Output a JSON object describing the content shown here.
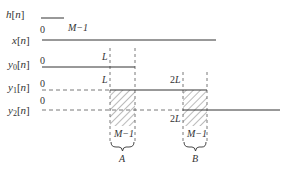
{
  "diagram": {
    "type": "overlap-add block convolution timing diagram",
    "signals": [
      {
        "id": "h",
        "label_main": "h",
        "label_arg": "[n]",
        "start": "0",
        "end": "M−1"
      },
      {
        "id": "x",
        "label_main": "x",
        "label_arg": "[n]",
        "start": "0"
      },
      {
        "id": "y0",
        "label_main": "y",
        "label_sub": "0",
        "label_arg": "[n]",
        "start": "0",
        "mark": "L"
      },
      {
        "id": "y1",
        "label_main": "y",
        "label_sub": "1",
        "label_arg": "[n]",
        "start": "0",
        "mark_start": "L",
        "mark_end": "2L"
      },
      {
        "id": "y2",
        "label_main": "y",
        "label_sub": "2",
        "label_arg": "[n]",
        "start": "0",
        "mark": "2L"
      }
    ],
    "regions": [
      {
        "id": "A",
        "label": "A",
        "width_label": "M−1"
      },
      {
        "id": "B",
        "label": "B",
        "width_label": "M−1"
      }
    ],
    "colors": {
      "line": "#333333",
      "hatch": "#555555",
      "background": "#ffffff"
    }
  }
}
